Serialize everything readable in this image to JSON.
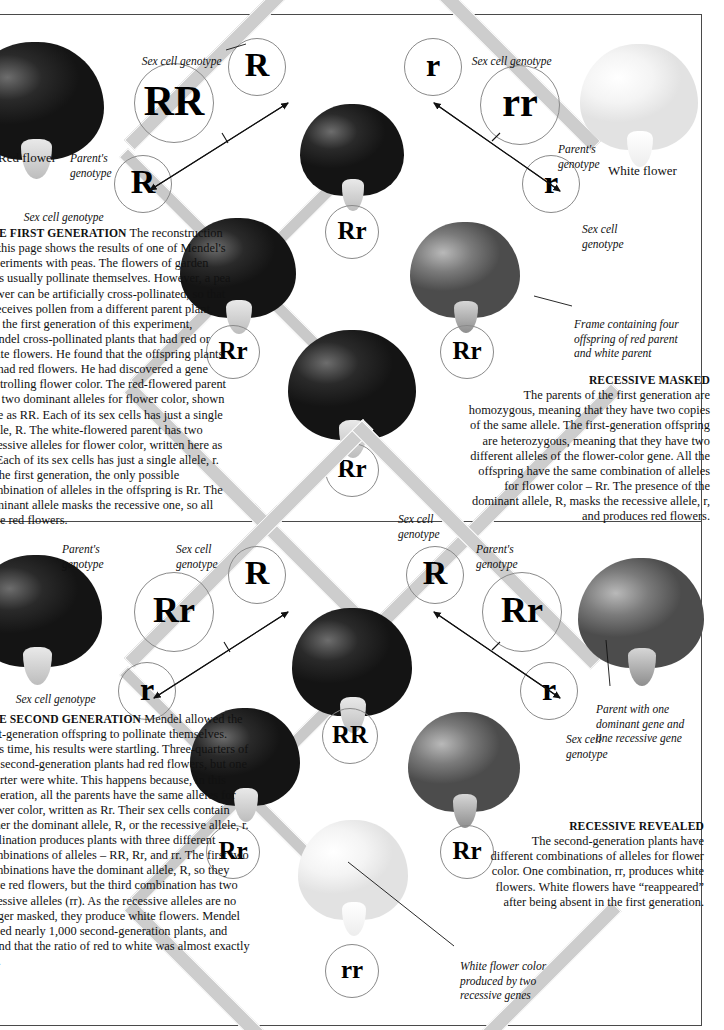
{
  "page": {
    "flower_labels": {
      "red_flower": "Red flower",
      "white_flower": "White flower"
    }
  },
  "gen1": {
    "parent_red": {
      "genotype": "RR",
      "gamete_top": "R",
      "gamete_bottom": "R",
      "label_sex_cell_top": "Sex cell genotype",
      "label_parent": "Parent's\ngenotype",
      "label_sex_cell_bottom": "Sex cell genotype"
    },
    "parent_white": {
      "genotype": "rr",
      "gamete_top": "r",
      "gamete_bottom": "r",
      "label_sex_cell_top": "Sex cell genotype",
      "label_parent": "Parent's\ngenotype",
      "label_sex_cell_bottom": "Sex cell\ngenotype"
    },
    "offspring": [
      "Rr",
      "Rr",
      "Rr",
      "Rr"
    ],
    "frame_label": "Frame containing four\noffspring of red parent\nand white parent",
    "text_left": {
      "heading": "THE FIRST GENERATION",
      "body": "The reconstruction on this page shows the results of one of Mendel's experiments with peas. The flowers of garden peas usually pollinate themselves. However, a pea flower can be artificially cross-pollinated, so that it receives pollen from a different parent plant. For the first generation of this experiment, Mendel cross-pollinated plants that had red or white flowers. He found that the offspring plants all had red flowers. He had discovered a gene controlling flower color. The red-flowered parent has two dominant alleles for flower color, shown here as RR. Each of its sex cells has just a single allele, R. The white-flowered parent has two recessive alleles for flower color, written here as rr. Each of its sex cells has just a single allele, r. In the first generation, the only possible combination of alleles in the offspring is Rr. The dominant allele masks the recessive one, so all have red flowers."
    },
    "text_right": {
      "heading": "RECESSIVE MASKED",
      "body": "The parents of the first generation are homozygous, meaning that they have two copies of the same allele. The first-generation offspring are heterozygous, meaning that they have two different alleles of the flower-color gene. All the offspring have the same combination of alleles for flower color – Rr. The presence of the dominant allele, R, masks the recessive allele, r, and produces red flowers."
    }
  },
  "gen2": {
    "parent_left": {
      "genotype": "Rr",
      "gamete_top": "R",
      "gamete_bottom": "r",
      "label_parent": "Parent's\ngenotype",
      "label_sex_cell_top": "Sex cell\ngenotype",
      "label_sex_cell_bottom": "Sex cell genotype"
    },
    "parent_right": {
      "genotype": "Rr",
      "gamete_top": "R",
      "gamete_bottom": "r",
      "label_parent": "Parent's\ngenotype",
      "label_sex_cell_top": "Sex cell\ngenotype",
      "label_sex_cell_bottom": "Sex cell\ngenotype"
    },
    "offspring": [
      "RR",
      "Rr",
      "Rr",
      "rr"
    ],
    "parent_note": "Parent with one\ndominant gene and\none recessive gene",
    "white_note": "White flower color\nproduced by two\nrecessive genes",
    "text_left": {
      "heading": "THE SECOND GENERATION",
      "body": "Mendel allowed the first-generation offspring to pollinate themselves. This time, his results were startling. Three-quarters of the second-generation plants had red flowers, but one quarter were white. This happens because, in this generation, all the parents have the same alleles for flower color, written as Rr. Their sex cells contain either the dominant allele, R, or the recessive allele, r. Pollination produces plants with three different combinations of alleles – RR, Rr, and rr. The first two combinations have the dominant allele, R, so they have red flowers, but the third combination has two recessive alleles (rr). As the recessive alleles are no longer masked, they produce white flowers. Mendel raised nearly 1,000 second-generation plants, and found that the ratio of red to white was almost exactly 3:1."
    },
    "text_right": {
      "heading": "RECESSIVE REVEALED",
      "body": "The second-generation plants have different combinations of alleles for flower color. One combination, rr, produces white flowers. White flowers have “reappeared” after being absent in the first generation."
    }
  },
  "colors": {
    "frame_gray": "#c9c9c9",
    "circle_stroke": "#8a8a8a",
    "rule": "#4a4a4a"
  }
}
